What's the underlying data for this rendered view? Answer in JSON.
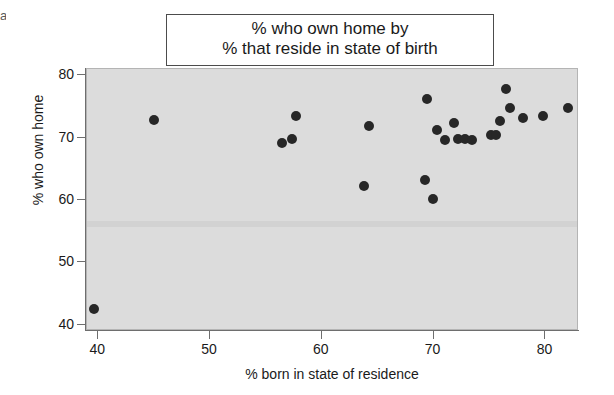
{
  "corner_mark": "a",
  "title": {
    "line1": "% who own home by",
    "line2": "% that reside in state of birth"
  },
  "axes": {
    "x_label": "% born in state of residence",
    "y_label": "% who own home",
    "x_ticks": [
      "40",
      "50",
      "60",
      "70",
      "80"
    ],
    "y_ticks": [
      "80",
      "70",
      "60",
      "50",
      "40"
    ]
  },
  "colors": {
    "panel_background": "#dcdcdc",
    "point": "#272727",
    "axis": "#6e6e6e",
    "text": "#1a1a1a",
    "title_border": "#4c4c4c"
  },
  "chart_data": {
    "type": "scatter",
    "title": "% who own home by % that reside in state of birth",
    "xlabel": "% born in state of residence",
    "ylabel": "% who own home",
    "xlim": [
      39,
      83
    ],
    "ylim": [
      39,
      81
    ],
    "xticks": [
      40,
      50,
      60,
      70,
      80
    ],
    "yticks": [
      40,
      50,
      60,
      70,
      80
    ],
    "grid": false,
    "legend": false,
    "marker": "filled-circle",
    "points": [
      {
        "x": 39.6,
        "y": 42.6
      },
      {
        "x": 45.0,
        "y": 72.8
      },
      {
        "x": 56.4,
        "y": 69.2
      },
      {
        "x": 57.3,
        "y": 69.8
      },
      {
        "x": 57.7,
        "y": 73.4
      },
      {
        "x": 63.8,
        "y": 62.2
      },
      {
        "x": 64.2,
        "y": 71.8
      },
      {
        "x": 69.2,
        "y": 63.2
      },
      {
        "x": 69.4,
        "y": 76.2
      },
      {
        "x": 69.9,
        "y": 60.2
      },
      {
        "x": 70.3,
        "y": 71.3
      },
      {
        "x": 71.0,
        "y": 69.6
      },
      {
        "x": 71.8,
        "y": 72.4
      },
      {
        "x": 72.2,
        "y": 69.8
      },
      {
        "x": 72.8,
        "y": 69.7
      },
      {
        "x": 73.4,
        "y": 69.6
      },
      {
        "x": 75.1,
        "y": 70.5
      },
      {
        "x": 75.6,
        "y": 70.4
      },
      {
        "x": 75.9,
        "y": 72.6
      },
      {
        "x": 76.5,
        "y": 77.8
      },
      {
        "x": 76.8,
        "y": 74.8
      },
      {
        "x": 78.0,
        "y": 73.2
      },
      {
        "x": 79.8,
        "y": 73.5
      },
      {
        "x": 82.0,
        "y": 74.7
      }
    ]
  }
}
